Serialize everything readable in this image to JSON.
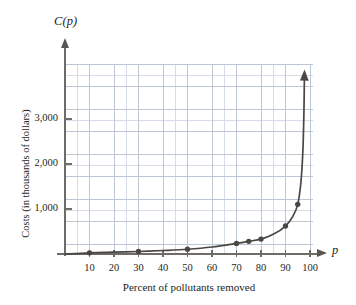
{
  "figure": {
    "axis_y_label": "C(p)",
    "axis_x_label": "p",
    "ytitle": "Costs (in thousands of dollars)",
    "xtitle": "Percent of pollutants removed"
  },
  "colors": {
    "curve": "#4a4643",
    "marker": "#4a4643",
    "axis": "#6f6c68",
    "grid_minor": "#d6dde8",
    "grid_major": "#bcc6d4",
    "background": "#ffffff"
  },
  "chart_data": {
    "type": "line",
    "title": "",
    "subtitle": "",
    "xlabel": "Percent of pollutants removed",
    "ylabel": "Costs (in thousands of dollars)",
    "x_axis_symbol": "p",
    "y_axis_symbol": "C(p)",
    "xlim": [
      0,
      106
    ],
    "ylim": [
      0,
      4200
    ],
    "grid": true,
    "legend": null,
    "xticks": [
      10,
      20,
      30,
      40,
      50,
      60,
      70,
      80,
      90,
      100
    ],
    "xticklabels": [
      "10",
      "20",
      "30",
      "40",
      "50",
      "60",
      "70",
      "80",
      "90",
      "100"
    ],
    "yticks": [
      1000,
      2000,
      3000
    ],
    "yticklabels": [
      "1,000",
      "2,000",
      "3,000"
    ],
    "series": [
      {
        "name": "Cost of removing pollutants",
        "marker_points": [
          {
            "x": 10,
            "y": 30
          },
          {
            "x": 30,
            "y": 60
          },
          {
            "x": 50,
            "y": 110
          },
          {
            "x": 70,
            "y": 240
          },
          {
            "x": 75,
            "y": 285
          },
          {
            "x": 80,
            "y": 335
          },
          {
            "x": 90,
            "y": 625
          },
          {
            "x": 95,
            "y": 1105
          }
        ],
        "curve_points": [
          {
            "x": 0,
            "y": 0
          },
          {
            "x": 10,
            "y": 30
          },
          {
            "x": 20,
            "y": 45
          },
          {
            "x": 30,
            "y": 60
          },
          {
            "x": 40,
            "y": 82
          },
          {
            "x": 50,
            "y": 110
          },
          {
            "x": 60,
            "y": 160
          },
          {
            "x": 70,
            "y": 240
          },
          {
            "x": 75,
            "y": 285
          },
          {
            "x": 80,
            "y": 335
          },
          {
            "x": 85,
            "y": 440
          },
          {
            "x": 90,
            "y": 625
          },
          {
            "x": 93,
            "y": 840
          },
          {
            "x": 95,
            "y": 1105
          },
          {
            "x": 96.3,
            "y": 1600
          },
          {
            "x": 97.1,
            "y": 2300
          },
          {
            "x": 97.5,
            "y": 3100
          },
          {
            "x": 97.7,
            "y": 3850
          }
        ],
        "asymptote_x": 100,
        "arrow_end": true
      }
    ],
    "annotations": []
  }
}
